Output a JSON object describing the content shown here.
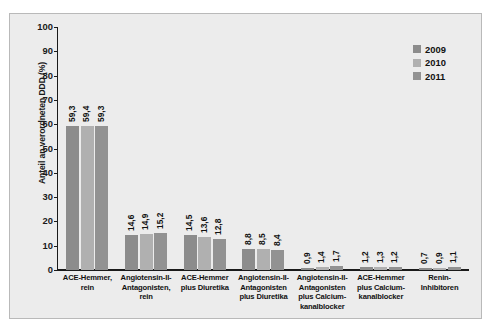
{
  "chart_data": {
    "type": "bar",
    "title": "",
    "xlabel": "",
    "ylabel": "Anteil an verordneten DDD (%)",
    "ylim": [
      0,
      100
    ],
    "yticks": [
      "0",
      "10",
      "20",
      "30",
      "40",
      "50",
      "60",
      "70",
      "80",
      "90",
      "100"
    ],
    "grid": false,
    "legend_position": "top-right",
    "categories": [
      "ACE-Hemmer, rein",
      "Angiotensin-II-Antagonisten, rein",
      "ACE-Hemmer plus Diuretika",
      "Angiotensin-II-Antagonisten plus Diuretika",
      "Angiotensin-II-Antagonisten plus Calcium-kanalblocker",
      "ACE-Hemmer plus Calcium-kanalblocker",
      "Renin-Inhibitoren"
    ],
    "category_lines": [
      [
        "ACE-Hemmer,",
        "rein"
      ],
      [
        "Angiotensin-II-",
        "Antagonisten,",
        "rein"
      ],
      [
        "ACE-Hemmer",
        "plus Diuretika"
      ],
      [
        "Angiotensin-II-",
        "Antagonisten",
        "plus Diuretika"
      ],
      [
        "Angiotensin-II-",
        "Antagonisten",
        "plus Calcium-",
        "kanalblocker"
      ],
      [
        "ACE-Hemmer",
        "plus Calcium-",
        "kanalblocker"
      ],
      [
        "Renin-",
        "Inhibitoren"
      ]
    ],
    "series": [
      {
        "name": "2009",
        "color": "#8c8c8c",
        "values": [
          59.3,
          14.6,
          14.5,
          8.8,
          0.9,
          1.2,
          0.7
        ],
        "labels": [
          "59,3",
          "14,6",
          "14,5",
          "8,8",
          "0,9",
          "1,2",
          "0,7"
        ]
      },
      {
        "name": "2010",
        "color": "#b0b0b0",
        "values": [
          59.4,
          14.9,
          13.6,
          8.5,
          1.4,
          1.3,
          0.9
        ],
        "labels": [
          "59,4",
          "14,9",
          "13,6",
          "8,5",
          "1,4",
          "1,3",
          "0,9"
        ]
      },
      {
        "name": "2011",
        "color": "#929292",
        "values": [
          59.3,
          15.2,
          12.8,
          8.4,
          1.7,
          1.2,
          1.1
        ],
        "labels": [
          "59,3",
          "15,2",
          "12,8",
          "8,4",
          "1,7",
          "1,2",
          "1,1"
        ]
      }
    ]
  },
  "legend": {
    "items": [
      {
        "label": "2009",
        "color": "#8c8c8c"
      },
      {
        "label": "2010",
        "color": "#b0b0b0"
      },
      {
        "label": "2011",
        "color": "#929292"
      }
    ]
  },
  "axis": {
    "y_title": "Anteil an verordneten DDD (%)"
  }
}
